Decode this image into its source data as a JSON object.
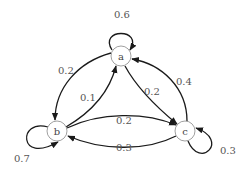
{
  "diagram": {
    "type": "markov-chain",
    "nodes": [
      {
        "id": "a",
        "label": "a"
      },
      {
        "id": "b",
        "label": "b"
      },
      {
        "id": "c",
        "label": "c"
      }
    ],
    "edges": [
      {
        "from": "a",
        "to": "a",
        "label": "0.6"
      },
      {
        "from": "a",
        "to": "b",
        "label": "0.2"
      },
      {
        "from": "b",
        "to": "a",
        "label": "0.1"
      },
      {
        "from": "a",
        "to": "c",
        "label": "0.2"
      },
      {
        "from": "c",
        "to": "a",
        "label": "0.4"
      },
      {
        "from": "b",
        "to": "c",
        "label": "0.2"
      },
      {
        "from": "c",
        "to": "b",
        "label": "0.3"
      },
      {
        "from": "b",
        "to": "b",
        "label": "0.7"
      },
      {
        "from": "c",
        "to": "c",
        "label": "0.3"
      }
    ]
  }
}
